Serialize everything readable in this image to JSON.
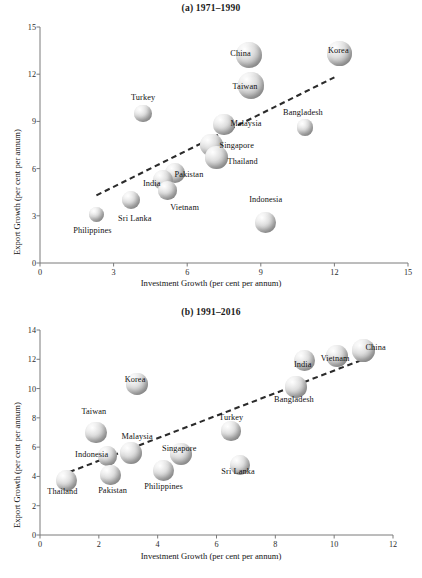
{
  "figure": {
    "axis_titles": {
      "x": "Investment Growth (per cent per annum)",
      "y": "Export Growth (per cent per annum)"
    }
  },
  "chart_data": [
    {
      "type": "scatter",
      "title": "(a) 1971–1990",
      "xlabel": "Investment Growth (per cent per annum)",
      "ylabel": "Export Growth (per cent per annum)",
      "xlim": [
        0,
        15
      ],
      "ylim": [
        0,
        15
      ],
      "xticks": [
        "0",
        "3",
        "6",
        "9",
        "12",
        "15"
      ],
      "yticks": [
        "0",
        "3",
        "6",
        "9",
        "12",
        "15"
      ],
      "xtick_values": [
        0,
        3,
        6,
        9,
        12,
        15
      ],
      "ytick_values": [
        0,
        3,
        6,
        9,
        12,
        15
      ],
      "grid": false,
      "legend": "none",
      "marker": "bubble",
      "trendline": {
        "x0": 2.3,
        "y0": 4.3,
        "x1": 12.0,
        "y1": 11.8,
        "style": "dashed"
      },
      "points": [
        {
          "label": "China",
          "x": 8.5,
          "y": 13.2,
          "size": 2.0,
          "label_dx": -8,
          "label_dy": -2
        },
        {
          "label": "Taiwan",
          "x": 8.6,
          "y": 11.3,
          "size": 2.1,
          "label_dx": -6,
          "label_dy": 1
        },
        {
          "label": "Korea",
          "x": 12.2,
          "y": 13.3,
          "size": 1.8,
          "label_dx": -1,
          "label_dy": -4
        },
        {
          "label": "Turkey",
          "x": 4.2,
          "y": 9.5,
          "size": 0.9,
          "label_dx": 0,
          "label_dy": -17
        },
        {
          "label": "Malaysia",
          "x": 7.5,
          "y": 8.8,
          "size": 1.4,
          "label_dx": 22,
          "label_dy": -2
        },
        {
          "label": "Bangladesh",
          "x": 10.8,
          "y": 8.6,
          "size": 0.8,
          "label_dx": -2,
          "label_dy": -16
        },
        {
          "label": "Singapore",
          "x": 7.0,
          "y": 7.5,
          "size": 1.5,
          "label_dx": 25,
          "label_dy": 0
        },
        {
          "label": "Thailand",
          "x": 7.2,
          "y": 6.7,
          "size": 1.5,
          "label_dx": 26,
          "label_dy": 3
        },
        {
          "label": "Pakistan",
          "x": 5.5,
          "y": 5.7,
          "size": 1.2,
          "label_dx": 14,
          "label_dy": 1
        },
        {
          "label": "India",
          "x": 5.0,
          "y": 5.3,
          "size": 1.2,
          "label_dx": -11,
          "label_dy": 3
        },
        {
          "label": "Vietnam",
          "x": 5.2,
          "y": 4.6,
          "size": 1.0,
          "label_dx": 17,
          "label_dy": 16
        },
        {
          "label": "Sri Lanka",
          "x": 3.7,
          "y": 4.0,
          "size": 1.0,
          "label_dx": 4,
          "label_dy": 18
        },
        {
          "label": "Philippines",
          "x": 2.3,
          "y": 3.1,
          "size": 0.7,
          "label_dx": -4,
          "label_dy": 16
        },
        {
          "label": "Indonesia",
          "x": 9.2,
          "y": 2.6,
          "size": 1.3,
          "label_dx": 0,
          "label_dy": -23
        }
      ]
    },
    {
      "type": "scatter",
      "title": "(b) 1991–2016",
      "xlabel": "Investment Growth (per cent per annum)",
      "ylabel": "Export Growth (per cent per annum)",
      "xlim": [
        0,
        12
      ],
      "ylim": [
        0,
        14
      ],
      "xticks": [
        "0",
        "2",
        "4",
        "6",
        "8",
        "10",
        "12"
      ],
      "yticks": [
        "0",
        "2",
        "4",
        "6",
        "8",
        "10",
        "12",
        "14"
      ],
      "xtick_values": [
        0,
        2,
        4,
        6,
        8,
        10,
        12
      ],
      "ytick_values": [
        0,
        2,
        4,
        6,
        8,
        10,
        12,
        14
      ],
      "grid": false,
      "legend": "none",
      "marker": "bubble",
      "trendline": {
        "x0": 1.0,
        "y0": 4.3,
        "x1": 11.0,
        "y1": 12.0,
        "style": "dashed"
      },
      "points": [
        {
          "label": "China",
          "x": 11.0,
          "y": 12.6,
          "size": 2.2,
          "label_dx": 12,
          "label_dy": -4
        },
        {
          "label": "Vietnam",
          "x": 10.1,
          "y": 12.2,
          "size": 1.9,
          "label_dx": -2,
          "label_dy": 2
        },
        {
          "label": "India",
          "x": 9.0,
          "y": 11.9,
          "size": 1.8,
          "label_dx": -2,
          "label_dy": 3
        },
        {
          "label": "Bangladesh",
          "x": 8.7,
          "y": 10.1,
          "size": 1.8,
          "label_dx": -2,
          "label_dy": 12
        },
        {
          "label": "Korea",
          "x": 3.3,
          "y": 10.3,
          "size": 1.8,
          "label_dx": -2,
          "label_dy": -5
        },
        {
          "label": "Taiwan",
          "x": 1.9,
          "y": 7.0,
          "size": 1.8,
          "label_dx": -2,
          "label_dy": -22
        },
        {
          "label": "Turkey",
          "x": 6.5,
          "y": 7.1,
          "size": 1.5,
          "label_dx": 0,
          "label_dy": -14
        },
        {
          "label": "Malaysia",
          "x": 3.1,
          "y": 5.6,
          "size": 1.9,
          "label_dx": 6,
          "label_dy": -17
        },
        {
          "label": "Singapore",
          "x": 4.8,
          "y": 5.5,
          "size": 1.9,
          "label_dx": -2,
          "label_dy": -6
        },
        {
          "label": "Indonesia",
          "x": 2.3,
          "y": 5.4,
          "size": 1.5,
          "label_dx": -16,
          "label_dy": -2
        },
        {
          "label": "Sri Lanka",
          "x": 6.8,
          "y": 4.8,
          "size": 1.6,
          "label_dx": -2,
          "label_dy": 6
        },
        {
          "label": "Philippines",
          "x": 4.2,
          "y": 4.4,
          "size": 1.7,
          "label_dx": 0,
          "label_dy": 15
        },
        {
          "label": "Pakistan",
          "x": 2.4,
          "y": 4.1,
          "size": 1.6,
          "label_dx": 2,
          "label_dy": 15
        },
        {
          "label": "Thailand",
          "x": 0.9,
          "y": 3.7,
          "size": 1.7,
          "label_dx": -4,
          "label_dy": 10
        }
      ]
    }
  ]
}
